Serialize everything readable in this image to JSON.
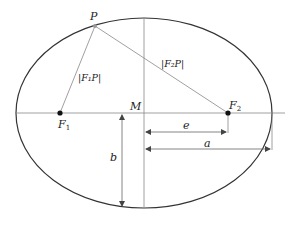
{
  "diagram": {
    "labels": {
      "point_p": "P",
      "center_m": "M",
      "focus_1": "F",
      "focus_1_sub": "1",
      "focus_2": "F",
      "focus_2_sub": "2",
      "dist_f1p": "|F₁P|",
      "dist_f2p": "|F₂P|",
      "semi_minor": "b",
      "semi_major": "a",
      "eccentricity": "e"
    },
    "colors": {
      "ellipse": "#333333",
      "lines": "#888888",
      "points": "#111111",
      "background": "#ffffff"
    }
  }
}
